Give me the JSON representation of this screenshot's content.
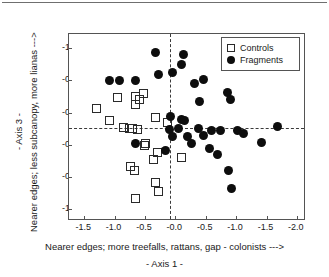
{
  "figure": {
    "page_rule": "",
    "x_axis": {
      "title_main": "Nearer edges;  more treefalls, rattans, gap  - colonists --->",
      "title_sub": "- Axis 1 -",
      "ticks": [
        "-1.5",
        "-1.0",
        "-0.5",
        "-0.0",
        "-0.5",
        "-1.0",
        "-1.5",
        "-2.0"
      ],
      "tick_values": [
        -1.5,
        -1.0,
        -0.5,
        0.0,
        0.5,
        1.0,
        1.5,
        2.0
      ],
      "range": [
        -1.75,
        2.15
      ]
    },
    "y_axis": {
      "title_main": "Nearer edges;  less subcanopy, more lianas --->",
      "title_sub": "- Axis 3 -",
      "ticks": [
        "-1.2",
        "-0.7",
        "-0.2",
        "-0.3",
        "-0.8",
        "-1.3"
      ],
      "tick_values": [
        1.2,
        0.7,
        0.2,
        -0.3,
        -0.8,
        -1.3
      ],
      "range": [
        -1.48,
        1.42
      ]
    },
    "legend": {
      "entries": [
        {
          "label": "Controls",
          "marker": "open-square-icon",
          "color": "#2a2a2a"
        },
        {
          "label": "Fragments",
          "marker": "filled-circle-icon",
          "color": "#0d0d0d"
        }
      ]
    },
    "reference_lines": {
      "vertical_x": -0.08,
      "horizontal_y": -0.04
    }
  },
  "chart_data": {
    "type": "scatter",
    "title": "",
    "subtitle": "",
    "xlabel": "Nearer edges;  more treefalls, rattans, gap  - colonists --->   - Axis 1 -",
    "ylabel": "Nearer edges;  less subcanopy, more lianas --->   - Axis 3 -",
    "xlim": [
      -1.75,
      2.15
    ],
    "ylim": [
      -1.48,
      1.42
    ],
    "xticks": [
      -1.5,
      -1.0,
      -0.5,
      0.0,
      0.5,
      1.0,
      1.5,
      2.0
    ],
    "xticklabels": [
      "-1.5",
      "-1.0",
      "-0.5",
      "-0.0",
      "-0.5",
      "-1.0",
      "-1.5",
      "-2.0"
    ],
    "yticks": [
      1.2,
      0.7,
      0.2,
      -0.3,
      -0.8,
      -1.3
    ],
    "yticklabels": [
      "-1.2",
      "-0.7",
      "-0.2",
      "-0.3",
      "-0.8",
      "-1.3"
    ],
    "grid": false,
    "legend_position": "top-right",
    "reference_lines": [
      {
        "orientation": "vertical",
        "value": -0.08,
        "style": "dashed"
      },
      {
        "orientation": "horizontal",
        "value": -0.04,
        "style": "dashed"
      }
    ],
    "series": [
      {
        "name": "Controls",
        "marker": "open-square",
        "color": "#2a2a2a",
        "points": [
          [
            -1.29,
            0.26
          ],
          [
            -0.95,
            0.43
          ],
          [
            -0.66,
            0.45
          ],
          [
            -0.66,
            0.33
          ],
          [
            -0.52,
            0.49
          ],
          [
            -0.59,
            0.41
          ],
          [
            -1.08,
            0.08
          ],
          [
            -0.85,
            -0.03
          ],
          [
            -0.76,
            -0.04
          ],
          [
            -0.7,
            -0.04
          ],
          [
            -0.62,
            -0.06
          ],
          [
            -0.33,
            0.13
          ],
          [
            -0.13,
            0.05
          ],
          [
            -0.49,
            -0.28
          ],
          [
            -0.5,
            -0.31
          ],
          [
            -0.3,
            -0.41
          ],
          [
            -0.36,
            -0.52
          ],
          [
            -0.73,
            -0.63
          ],
          [
            -0.68,
            -0.7
          ],
          [
            -0.33,
            -0.88
          ],
          [
            -0.28,
            -1.03
          ],
          [
            -0.66,
            -1.13
          ],
          [
            0.1,
            -0.5
          ]
        ]
      },
      {
        "name": "Fragments",
        "marker": "filled-circle",
        "color": "#0d0d0d",
        "points": [
          [
            -0.32,
            1.13
          ],
          [
            0.14,
            1.1
          ],
          [
            0.1,
            0.94
          ],
          [
            -0.05,
            0.82
          ],
          [
            -0.27,
            0.79
          ],
          [
            -1.08,
            0.7
          ],
          [
            -0.92,
            0.7
          ],
          [
            -0.65,
            0.7
          ],
          [
            0.32,
            0.65
          ],
          [
            0.46,
            0.71
          ],
          [
            0.4,
            0.37
          ],
          [
            0.86,
            0.52
          ],
          [
            0.9,
            0.41
          ],
          [
            -0.08,
            0.14
          ],
          [
            0.1,
            0.09
          ],
          [
            0.15,
            0.08
          ],
          [
            -0.09,
            -0.06
          ],
          [
            0.05,
            -0.05
          ],
          [
            0.38,
            -0.05
          ],
          [
            0.6,
            -0.07
          ],
          [
            0.75,
            -0.07
          ],
          [
            1.02,
            -0.08
          ],
          [
            1.68,
            -0.01
          ],
          [
            -0.05,
            -0.17
          ],
          [
            0.2,
            -0.17
          ],
          [
            0.46,
            -0.15
          ],
          [
            1.12,
            -0.13
          ],
          [
            -0.66,
            -0.28
          ],
          [
            0.26,
            -0.28
          ],
          [
            0.56,
            -0.36
          ],
          [
            1.42,
            -0.26
          ],
          [
            -0.17,
            -0.38
          ],
          [
            0.7,
            -0.45
          ],
          [
            0.88,
            -0.7
          ],
          [
            0.93,
            -0.97
          ]
        ]
      }
    ]
  }
}
